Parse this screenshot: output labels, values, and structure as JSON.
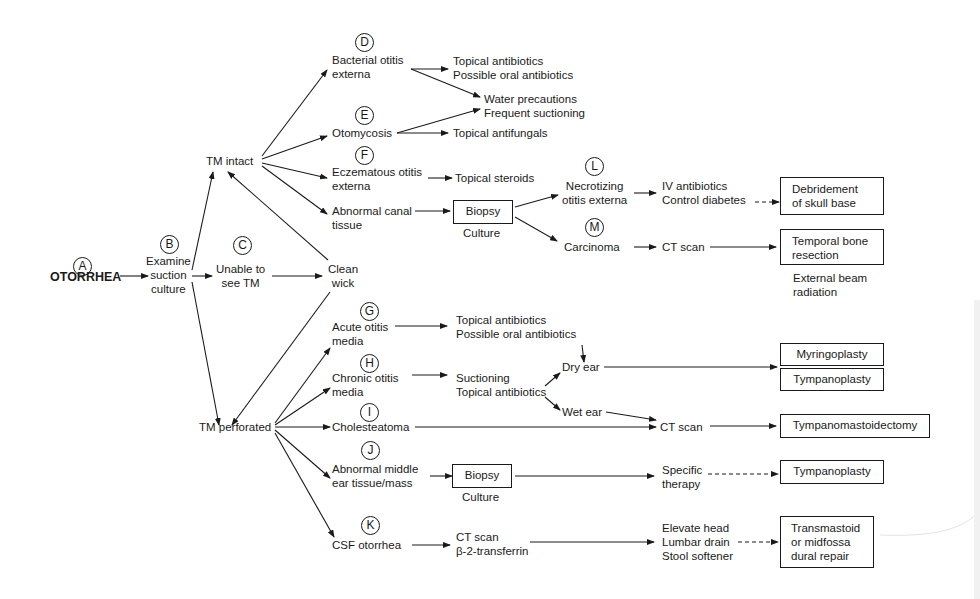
{
  "diagram": {
    "title": "OTORRHEA",
    "nodes": {
      "A": {
        "letter": "A",
        "label": "OTORRHEA"
      },
      "B": {
        "letter": "B",
        "label": "Examine\nsuction\nculture"
      },
      "C": {
        "letter": "C",
        "label": "Unable to\nsee TM"
      },
      "clean_wick": {
        "label": "Clean\nwick"
      },
      "tm_intact": {
        "label": "TM intact"
      },
      "tm_perforated": {
        "label": "TM perforated"
      },
      "D": {
        "letter": "D",
        "label": "Bacterial otitis\nexterna"
      },
      "E": {
        "letter": "E",
        "label": "Otomycosis"
      },
      "F": {
        "letter": "F",
        "label": "Eczematous otitis\nexterna"
      },
      "abnormal_canal": {
        "label": "Abnormal canal\ntissue"
      },
      "G": {
        "letter": "G",
        "label": "Acute otitis\nmedia"
      },
      "H": {
        "letter": "H",
        "label": "Chronic otitis\nmedia"
      },
      "I": {
        "letter": "I",
        "label": "Cholesteatoma"
      },
      "J": {
        "letter": "J",
        "label": "Abnormal middle\near tissue/mass"
      },
      "K": {
        "letter": "K",
        "label": "CSF otorrhea"
      },
      "L": {
        "letter": "L",
        "label": "Necrotizing\notitis externa"
      },
      "M": {
        "letter": "M",
        "label": "Carcinoma"
      }
    },
    "treatments": {
      "d_tx": "Topical antibiotics\nPossible oral antibiotics",
      "water": "Water precautions\nFrequent suctioning",
      "e_tx": "Topical antifungals",
      "f_tx": "Topical steroids",
      "biopsy_canal": "Biopsy",
      "culture_canal": "Culture",
      "l_tx": "IV antibiotics\nControl diabetes",
      "l_surgery": "Debridement\nof skull base",
      "m_tx": "CT scan",
      "m_surgery": "Temporal bone\nresection",
      "m_radiation": "External beam\nradiation",
      "g_tx": "Topical antibiotics\nPossible oral antibiotics",
      "h_tx": "Suctioning\nTopical antibiotics",
      "dry_ear": "Dry ear",
      "wet_ear": "Wet ear",
      "myringoplasty": "Myringoplasty",
      "tympanoplasty_1": "Tympanoplasty",
      "ct_scan_i": "CT scan",
      "tympanomastoidectomy": "Tympanomastoidectomy",
      "biopsy_middle": "Biopsy",
      "culture_middle": "Culture",
      "specific_therapy": "Specific\ntherapy",
      "tympanoplasty_2": "Tympanoplasty",
      "k_tx": "CT scan\nβ-2-transferrin",
      "k_conservative": "Elevate head\nLumbar drain\nStool softener",
      "k_surgery": "Transmastoid\nor midfossa\ndural repair"
    }
  }
}
